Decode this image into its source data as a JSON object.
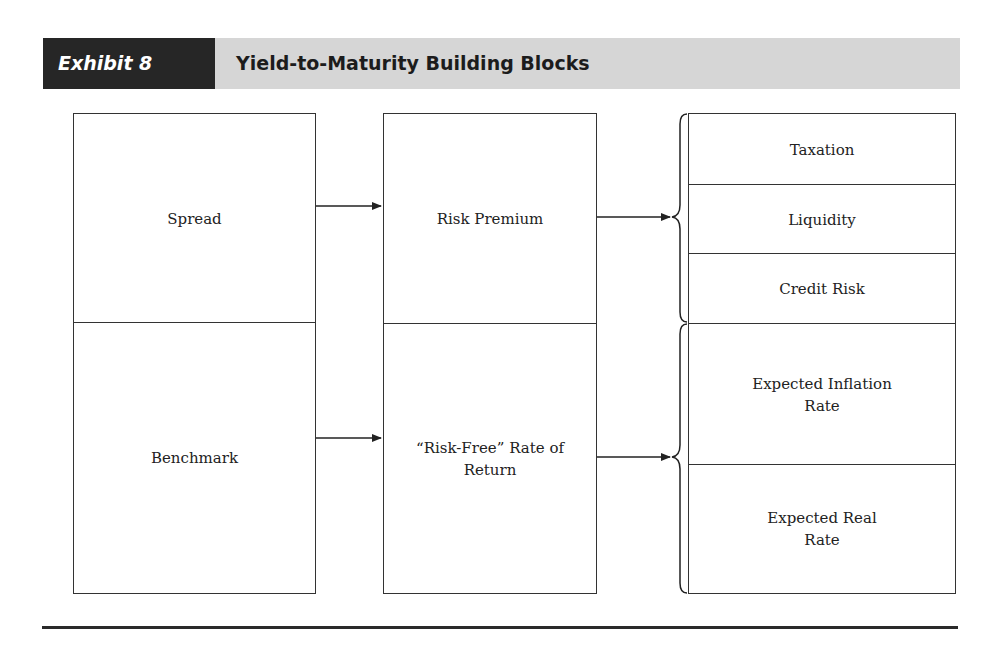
{
  "exhibit": {
    "label": "Exhibit 8",
    "title": "Yield-to-Maturity Building Blocks"
  },
  "colors": {
    "label_bg": "#262626",
    "band_bg": "#d6d6d6",
    "line": "#333333"
  },
  "diagram": {
    "left_column": {
      "top": "Spread",
      "bottom": "Benchmark"
    },
    "middle_column": {
      "top": "Risk Premium",
      "bottom": "“Risk-Free” Rate of Return"
    },
    "right_column": {
      "risk_premium_components": [
        "Taxation",
        "Liquidity",
        "Credit Risk"
      ],
      "risk_free_components": [
        "Expected Inflation Rate",
        "Expected Real Rate"
      ]
    },
    "edges": [
      {
        "from": "Spread",
        "to": "Risk Premium"
      },
      {
        "from": "Benchmark",
        "to": "“Risk-Free” Rate of Return"
      },
      {
        "from": "Risk Premium",
        "to": [
          "Taxation",
          "Liquidity",
          "Credit Risk"
        ]
      },
      {
        "from": "“Risk-Free” Rate of Return",
        "to": [
          "Expected Inflation Rate",
          "Expected Real Rate"
        ]
      }
    ]
  }
}
